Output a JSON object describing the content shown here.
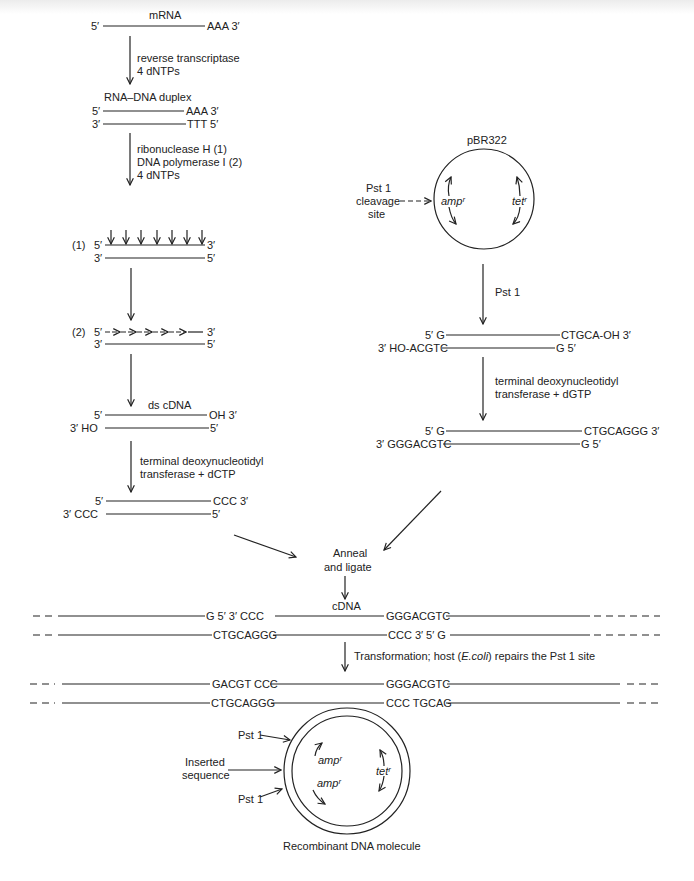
{
  "left_pathway": {
    "mrna": {
      "label": "mRNA",
      "left": "5′",
      "right": "AAA 3′"
    },
    "step1": {
      "line1": "reverse transcriptase",
      "line2": "4 dNTPs"
    },
    "duplex_title": "RNA–DNA duplex",
    "duplex": {
      "top_left": "5′",
      "top_right": "AAA 3′",
      "bottom_left": "3′",
      "bottom_right": "TTT  5′"
    },
    "step2": {
      "line1": "ribonuclease H (1)",
      "line2": "DNA polymerase I (2)",
      "line3": "4 dNTPs"
    },
    "stage1": {
      "num": "(1)",
      "top_left": "5′",
      "top_right": "3′",
      "bottom_left": "3′",
      "bottom_right": "5′"
    },
    "stage2": {
      "num": "(2)",
      "top_left": "5′",
      "top_right": "3′",
      "bottom_left": "3′",
      "bottom_right": "5′"
    },
    "ds_cdna": {
      "label": "ds cDNA",
      "top_left": "5′",
      "top_right": "OH 3′",
      "bottom_left": "3′  HO",
      "bottom_right": "5′"
    },
    "step3": {
      "line1": "terminal deoxynucleotidyl",
      "line2": "transferase  +  dCTP"
    },
    "tailed": {
      "top_left": "5′",
      "top_right": "CCC 3′",
      "bottom_left": "3′  CCC",
      "bottom_right": "5′"
    }
  },
  "right_pathway": {
    "plasmid": {
      "name": "pBR322",
      "site_line1": "Pst 1",
      "site_line2": "cleavage",
      "site_line3": "site",
      "gene_amp": "ampʳ",
      "gene_tet": "tetʳ"
    },
    "step1": {
      "label": "Pst 1"
    },
    "cut": {
      "top_left": "5′ G",
      "top_right": "CTGCA-OH 3′",
      "bottom_left": "3′ HO-ACGTC",
      "bottom_right": "G 5′"
    },
    "step2": {
      "line1": "terminal deoxynucleotidyl",
      "line2": "transferase  +  dGTP"
    },
    "tailed": {
      "top_left": "5′ G",
      "top_right": "CTGCAGGG 3′",
      "bottom_left": "3′ GGGACGTC",
      "bottom_right": "G 5′"
    }
  },
  "merge": {
    "line1": "Anneal",
    "line2": "and ligate"
  },
  "annealed": {
    "insert_label": "cDNA",
    "top_a": "G 5′   3′ CCC",
    "top_b": "GGGACGTC",
    "bottom_a": "CTGCAGGG",
    "bottom_b": "CCC 3′   5′ G"
  },
  "transformation": {
    "prefix": "Transformation; host (",
    "organism": "E.coli",
    "suffix": ") repairs the Pst 1 site"
  },
  "repaired": {
    "top_a": "GACGT CCC",
    "top_b": "GGGACGTC",
    "bottom_a": "CTGCAGGG",
    "bottom_b": "CCC TGCAG"
  },
  "recombinant": {
    "pst_top": "Pst 1",
    "inserted_line1": "Inserted",
    "inserted_line2": "sequence",
    "pst_bottom": "Pst 1",
    "gene_amp_top": "ampʳ",
    "gene_amp_bottom": "ampʳ",
    "gene_tet": "tetʳ",
    "caption": "Recombinant DNA molecule"
  }
}
